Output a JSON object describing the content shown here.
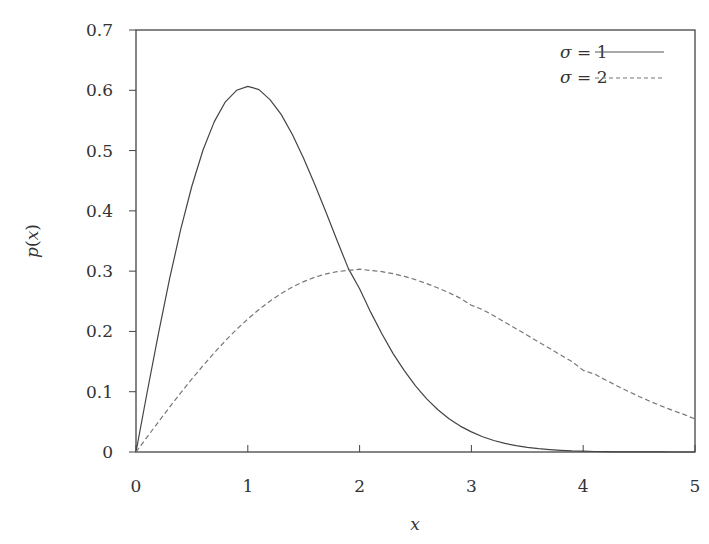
{
  "chart_data": {
    "type": "line",
    "title": "",
    "xlabel": "x",
    "ylabel": "p(x)",
    "xlim": [
      0,
      5
    ],
    "ylim": [
      0,
      0.7
    ],
    "xticks": [
      "0",
      "1",
      "2",
      "3",
      "4",
      "5"
    ],
    "yticks": [
      "0",
      "0.1",
      "0.2",
      "0.3",
      "0.4",
      "0.5",
      "0.6",
      "0.7"
    ],
    "grid": false,
    "legend_position": "upper right",
    "x": [
      0,
      0.1,
      0.2,
      0.3,
      0.4,
      0.5,
      0.6,
      0.7,
      0.8,
      0.9,
      1.0,
      1.1,
      1.2,
      1.3,
      1.4,
      1.5,
      1.6,
      1.7,
      1.8,
      1.9,
      2.0,
      2.1,
      2.2,
      2.3,
      2.4,
      2.5,
      2.6,
      2.7,
      2.8,
      2.9,
      3.0,
      3.1,
      3.2,
      3.3,
      3.4,
      3.5,
      3.6,
      3.7,
      3.8,
      3.9,
      4.0,
      4.1,
      4.2,
      4.3,
      4.4,
      4.5,
      4.6,
      4.7,
      4.8,
      4.9,
      5.0
    ],
    "series": [
      {
        "name": "σ = 1",
        "style": "solid",
        "values": [
          0,
          0.0995,
          0.196,
          0.2867,
          0.3692,
          0.4412,
          0.5012,
          0.548,
          0.5809,
          0.6,
          0.6065,
          0.6012,
          0.5841,
          0.5596,
          0.5262,
          0.487,
          0.4434,
          0.3972,
          0.3504,
          0.3042,
          0.2707,
          0.2316,
          0.1958,
          0.1632,
          0.1351,
          0.1098,
          0.0881,
          0.0701,
          0.0553,
          0.043,
          0.0333,
          0.0254,
          0.019,
          0.0142,
          0.0105,
          0.0076,
          0.0055,
          0.004,
          0.0028,
          0.0019,
          0.0013,
          0.0009,
          0.0006,
          0.0004,
          0.0003,
          0.0002,
          0.0001,
          0.0001,
          0,
          0,
          0
        ]
      },
      {
        "name": "σ = 2",
        "style": "dashed",
        "values": [
          0,
          0.025,
          0.0498,
          0.0742,
          0.098,
          0.1212,
          0.1434,
          0.1646,
          0.1846,
          0.2033,
          0.2206,
          0.2363,
          0.2504,
          0.2629,
          0.2737,
          0.2827,
          0.29,
          0.2955,
          0.2993,
          0.3013,
          0.3033,
          0.301,
          0.299,
          0.2957,
          0.2913,
          0.2858,
          0.2794,
          0.2721,
          0.264,
          0.2553,
          0.2435,
          0.2362,
          0.2259,
          0.2153,
          0.2045,
          0.1936,
          0.1826,
          0.1717,
          0.1608,
          0.1501,
          0.1353,
          0.1294,
          0.1195,
          0.1099,
          0.1008,
          0.0921,
          0.0839,
          0.0762,
          0.069,
          0.0623,
          0.0549
        ]
      }
    ]
  },
  "legend": {
    "items": [
      {
        "symbol": "σ",
        "eq": " = ",
        "value": "1"
      },
      {
        "symbol": "σ",
        "eq": " = ",
        "value": "2"
      }
    ]
  },
  "axes": {
    "xlabel": "x",
    "ylabel_fn": "p",
    "ylabel_arg": "x"
  }
}
